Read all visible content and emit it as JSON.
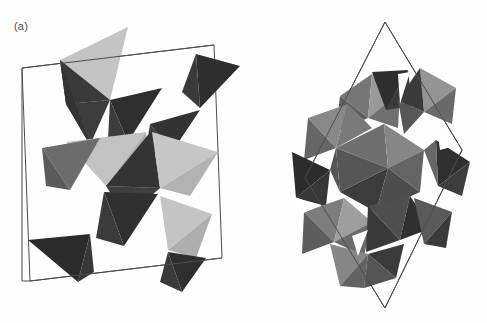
{
  "figure": {
    "type": "crystal-structure-polyhedral-diagram",
    "background_color": "#fefefe",
    "panels": [
      {
        "id": "a",
        "label": "(a)",
        "description": "Corner-sharing tetrahedral chain within a monoclinic unit cell outline",
        "polyhedron_type": "tetrahedron",
        "cell_outline_color": "#4d4d4d"
      },
      {
        "id": "b",
        "label": "(b)",
        "description": "Dense edge-sharing octahedral framework within a rhombic unit cell outline",
        "polyhedron_type": "octahedron",
        "cell_outline_color": "#4d4d4d"
      }
    ]
  },
  "shading": {
    "dark": "#373737",
    "mid_dark": "#5a5a5a",
    "medium": "#6e6e6e",
    "mid_light": "#8d8d8d",
    "light": "#b4b4b4",
    "pale": "#c9c9c9",
    "white": "#ffffff",
    "outline": "#4d4d4d"
  },
  "geometry": {
    "panel_a_cell": "22,68 214,45 222,258 30,281",
    "panel_b_cell": "385,22 462,150 385,308 305,178"
  }
}
